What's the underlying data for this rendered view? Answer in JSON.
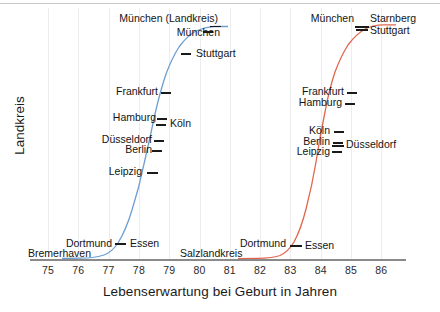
{
  "chart_data": {
    "type": "line",
    "title": "",
    "xlabel": "Lebenserwartung bei Geburt in Jahren",
    "ylabel": "Landkreis",
    "xlim": [
      75,
      86
    ],
    "ylim": [
      0,
      1
    ],
    "grid": true,
    "legend": "none",
    "xticks": [
      "75",
      "76",
      "77",
      "78",
      "79",
      "80",
      "81",
      "82",
      "83",
      "84",
      "85",
      "86"
    ],
    "yticks": [],
    "series": [
      {
        "name": "blue-curve",
        "color": "#6e9fd0",
        "note": "Linke S-Kurve: Landkreise nach Lebenserwartung sortiert",
        "annotations": [
          {
            "label": "München (Landkreis)",
            "x": 80.9,
            "y": 0.985,
            "side": "left"
          },
          {
            "label": "München",
            "x": 80.6,
            "y": 0.945,
            "side": "left"
          },
          {
            "label": "Stuttgart",
            "x": 79.8,
            "y": 0.885,
            "side": "right"
          },
          {
            "label": "Frankfurt",
            "x": 78.6,
            "y": 0.715,
            "side": "left"
          },
          {
            "label": "Hamburg",
            "x": 78.5,
            "y": 0.64,
            "side": "left"
          },
          {
            "label": "Köln",
            "x": 78.5,
            "y": 0.62,
            "side": "right"
          },
          {
            "label": "Düsseldorf",
            "x": 78.4,
            "y": 0.558,
            "side": "left"
          },
          {
            "label": "Berlin",
            "x": 78.3,
            "y": 0.525,
            "side": "left"
          },
          {
            "label": "Leipzig",
            "x": 78.1,
            "y": 0.447,
            "side": "left"
          },
          {
            "label": "Essen",
            "x": 77.4,
            "y": 0.075,
            "side": "right"
          },
          {
            "label": "Dortmund",
            "x": 77.3,
            "y": 0.075,
            "side": "left"
          },
          {
            "label": "Bremerhaven",
            "x": 76.2,
            "y": 0.01,
            "side": "left"
          }
        ]
      },
      {
        "name": "red-curve",
        "color": "#e2664e",
        "note": "Rechte S-Kurve: Landkreise nach Lebenserwartung sortiert",
        "annotations": [
          {
            "label": "Starnberg",
            "x": 85.5,
            "y": 0.975,
            "side": "right"
          },
          {
            "label": "München",
            "x": 85.3,
            "y": 0.975,
            "side": "left"
          },
          {
            "label": "Stuttgart",
            "x": 85.4,
            "y": 0.94,
            "side": "right"
          },
          {
            "label": "Frankfurt",
            "x": 83.8,
            "y": 0.718,
            "side": "left"
          },
          {
            "label": "Hamburg",
            "x": 83.8,
            "y": 0.69,
            "side": "left"
          },
          {
            "label": "Köln",
            "x": 83.7,
            "y": 0.598,
            "side": "left"
          },
          {
            "label": "Berlin",
            "x": 83.7,
            "y": 0.563,
            "side": "left"
          },
          {
            "label": "Düsseldorf",
            "x": 83.7,
            "y": 0.553,
            "side": "right"
          },
          {
            "label": "Leipzig",
            "x": 83.6,
            "y": 0.53,
            "side": "left"
          },
          {
            "label": "Essen",
            "x": 83.0,
            "y": 0.078,
            "side": "right"
          },
          {
            "label": "Dortmund",
            "x": 82.9,
            "y": 0.078,
            "side": "left"
          },
          {
            "label": "Salzlandkreis",
            "x": 81.9,
            "y": 0.012,
            "side": "left"
          }
        ]
      }
    ]
  }
}
